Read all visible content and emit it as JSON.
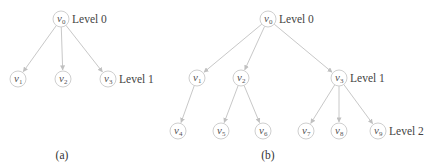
{
  "colors": {
    "node_stroke": "#cfcfcf",
    "edge": "#c8c8c8",
    "text": "#444444"
  },
  "diagrams": [
    {
      "caption": "(a)",
      "nodes": [
        {
          "id": "v0",
          "base": "v",
          "sub": "0",
          "x": 61,
          "y": 19
        },
        {
          "id": "v1",
          "base": "v",
          "sub": "1",
          "x": 18,
          "y": 79
        },
        {
          "id": "v2",
          "base": "v",
          "sub": "2",
          "x": 63,
          "y": 79
        },
        {
          "id": "v3",
          "base": "v",
          "sub": "3",
          "x": 108,
          "y": 79
        }
      ],
      "edges": [
        [
          "v0",
          "v1"
        ],
        [
          "v0",
          "v2"
        ],
        [
          "v0",
          "v3"
        ]
      ],
      "level_labels": [
        {
          "text": "Level 0",
          "x": 72,
          "y": 23
        },
        {
          "text": "Level 1",
          "x": 119,
          "y": 83
        }
      ]
    },
    {
      "caption": "(b)",
      "nodes": [
        {
          "id": "v0",
          "base": "v",
          "sub": "0",
          "x": 268,
          "y": 19
        },
        {
          "id": "v1",
          "base": "v",
          "sub": "1",
          "x": 197,
          "y": 78
        },
        {
          "id": "v2",
          "base": "v",
          "sub": "2",
          "x": 241,
          "y": 78
        },
        {
          "id": "v3",
          "base": "v",
          "sub": "3",
          "x": 339,
          "y": 78
        },
        {
          "id": "v4",
          "base": "v",
          "sub": "4",
          "x": 178,
          "y": 131
        },
        {
          "id": "v5",
          "base": "v",
          "sub": "5",
          "x": 221,
          "y": 131
        },
        {
          "id": "v6",
          "base": "v",
          "sub": "6",
          "x": 263,
          "y": 131
        },
        {
          "id": "v7",
          "base": "v",
          "sub": "7",
          "x": 306,
          "y": 131
        },
        {
          "id": "v8",
          "base": "v",
          "sub": "8",
          "x": 339,
          "y": 131
        },
        {
          "id": "v9",
          "base": "v",
          "sub": "9",
          "x": 378,
          "y": 131
        }
      ],
      "edges": [
        [
          "v0",
          "v1"
        ],
        [
          "v0",
          "v2"
        ],
        [
          "v0",
          "v3"
        ],
        [
          "v1",
          "v4"
        ],
        [
          "v2",
          "v5"
        ],
        [
          "v2",
          "v6"
        ],
        [
          "v3",
          "v7"
        ],
        [
          "v3",
          "v8"
        ],
        [
          "v3",
          "v9"
        ]
      ],
      "level_labels": [
        {
          "text": "Level 0",
          "x": 279,
          "y": 23
        },
        {
          "text": "Level 1",
          "x": 350,
          "y": 82
        },
        {
          "text": "Level 2",
          "x": 389,
          "y": 135
        }
      ]
    }
  ],
  "captions": {
    "a": "(a)",
    "b": "(b)"
  }
}
